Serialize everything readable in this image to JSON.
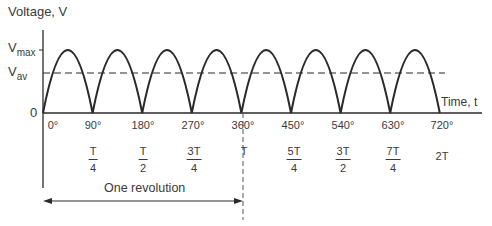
{
  "diagram": {
    "y_axis_label": "Voltage, V",
    "x_axis_label": "Time, t",
    "vmax_label": {
      "main": "V",
      "sub": "max"
    },
    "vav_label": {
      "main": "V",
      "sub": "av"
    },
    "origin_label": "0",
    "angle_ticks": [
      "0°",
      "90°",
      "180°",
      "270°",
      "360°",
      "450°",
      "540°",
      "630°",
      "720°"
    ],
    "time_ticks": [
      {
        "num": "T",
        "den": "4"
      },
      {
        "num": "T",
        "den": "2"
      },
      {
        "num": "3T",
        "den": "4"
      },
      {
        "single": "T"
      },
      {
        "num": "5T",
        "den": "4"
      },
      {
        "num": "3T",
        "den": "2"
      },
      {
        "num": "7T",
        "den": "4"
      },
      {
        "single": "2T"
      }
    ],
    "revolution_label": "One revolution",
    "colors": {
      "line": "#2a2a2a",
      "text": "#3a3a3a"
    }
  }
}
